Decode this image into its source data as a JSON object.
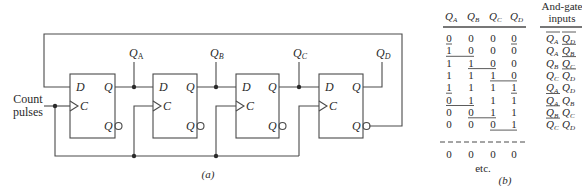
{
  "circuit": {
    "input_label_line1": "Count",
    "input_label_line2": "pulses",
    "caption": "(a)",
    "flip_flops": [
      {
        "id": "A",
        "d_label": "D",
        "c_label": "C",
        "q_label": "Q",
        "qbar_label": "Q",
        "output_label": "Q",
        "output_sub": "A"
      },
      {
        "id": "B",
        "d_label": "D",
        "c_label": "C",
        "q_label": "Q",
        "qbar_label": "Q",
        "output_label": "Q",
        "output_sub": "B"
      },
      {
        "id": "C",
        "d_label": "D",
        "c_label": "C",
        "q_label": "Q",
        "qbar_label": "Q",
        "output_label": "Q",
        "output_sub": "C"
      },
      {
        "id": "D",
        "d_label": "D",
        "c_label": "C",
        "q_label": "Q",
        "qbar_label": "Q",
        "output_label": "Q",
        "output_sub": "D"
      }
    ]
  },
  "table": {
    "caption": "(b)",
    "headers": [
      {
        "main": "Q",
        "sub": "A"
      },
      {
        "main": "Q",
        "sub": "B"
      },
      {
        "main": "Q",
        "sub": "C"
      },
      {
        "main": "Q",
        "sub": "D"
      }
    ],
    "gate_header_line1": "And-gate",
    "gate_header_line2": "inputs",
    "rows": [
      [
        "0",
        "0",
        "0",
        "0"
      ],
      [
        "1",
        "0",
        "0",
        "0"
      ],
      [
        "1",
        "1",
        "0",
        "0"
      ],
      [
        "1",
        "1",
        "1",
        "0"
      ],
      [
        "1",
        "1",
        "1",
        "1"
      ],
      [
        "0",
        "1",
        "1",
        "1"
      ],
      [
        "0",
        "0",
        "1",
        "1"
      ],
      [
        "0",
        "0",
        "0",
        "1"
      ]
    ],
    "final_row": [
      "0",
      "0",
      "0",
      "0"
    ],
    "etc_label": "etc.",
    "gate_inputs": [
      [
        {
          "v": "Q",
          "s": "A",
          "bar": true
        },
        {
          "v": "Q",
          "s": "D",
          "bar": true
        }
      ],
      [
        {
          "v": "Q",
          "s": "A",
          "bar": false
        },
        {
          "v": "Q",
          "s": "B",
          "bar": true
        }
      ],
      [
        {
          "v": "Q",
          "s": "B",
          "bar": false
        },
        {
          "v": "Q",
          "s": "C",
          "bar": true
        }
      ],
      [
        {
          "v": "Q",
          "s": "C",
          "bar": false
        },
        {
          "v": "Q",
          "s": "D",
          "bar": true
        }
      ],
      [
        {
          "v": "Q",
          "s": "A",
          "bar": false
        },
        {
          "v": "Q",
          "s": "D",
          "bar": false
        }
      ],
      [
        {
          "v": "Q",
          "s": "A",
          "bar": true
        },
        {
          "v": "Q",
          "s": "B",
          "bar": false
        }
      ],
      [
        {
          "v": "Q",
          "s": "B",
          "bar": true
        },
        {
          "v": "Q",
          "s": "C",
          "bar": false
        }
      ],
      [
        {
          "v": "Q",
          "s": "C",
          "bar": true
        },
        {
          "v": "Q",
          "s": "D",
          "bar": false
        }
      ]
    ]
  },
  "colors": {
    "line": "#4a4a4a",
    "text": "#2a2a2a",
    "background": "#ffffff"
  }
}
